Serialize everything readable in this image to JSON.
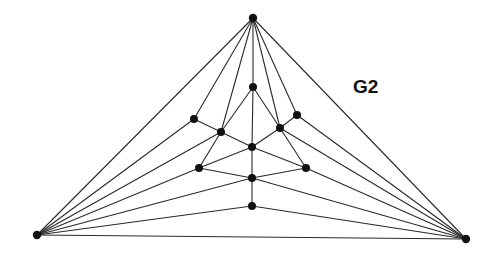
{
  "figure": {
    "label": "G2",
    "colors": {
      "edge": "#2a2a2a",
      "node": "#111111",
      "background": "#ffffff"
    },
    "nodes": [
      {
        "id": "T",
        "x": 253,
        "y": 18
      },
      {
        "id": "L",
        "x": 37,
        "y": 235
      },
      {
        "id": "R",
        "x": 466,
        "y": 239
      },
      {
        "id": "A",
        "x": 194,
        "y": 119
      },
      {
        "id": "B",
        "x": 221,
        "y": 132
      },
      {
        "id": "C",
        "x": 253,
        "y": 87
      },
      {
        "id": "D",
        "x": 280,
        "y": 128
      },
      {
        "id": "E",
        "x": 297,
        "y": 115
      },
      {
        "id": "M",
        "x": 252,
        "y": 147
      },
      {
        "id": "F",
        "x": 199,
        "y": 168
      },
      {
        "id": "G",
        "x": 306,
        "y": 168
      },
      {
        "id": "H",
        "x": 252,
        "y": 178
      },
      {
        "id": "I",
        "x": 252,
        "y": 206
      }
    ],
    "edges": [
      [
        "T",
        "L"
      ],
      [
        "T",
        "R"
      ],
      [
        "T",
        "A"
      ],
      [
        "T",
        "B"
      ],
      [
        "T",
        "C"
      ],
      [
        "T",
        "D"
      ],
      [
        "T",
        "E"
      ],
      [
        "L",
        "R"
      ],
      [
        "L",
        "A"
      ],
      [
        "L",
        "B"
      ],
      [
        "L",
        "F"
      ],
      [
        "L",
        "H"
      ],
      [
        "L",
        "I"
      ],
      [
        "R",
        "E"
      ],
      [
        "R",
        "D"
      ],
      [
        "R",
        "G"
      ],
      [
        "R",
        "H"
      ],
      [
        "R",
        "I"
      ],
      [
        "A",
        "B"
      ],
      [
        "E",
        "D"
      ],
      [
        "C",
        "B"
      ],
      [
        "C",
        "D"
      ],
      [
        "C",
        "M"
      ],
      [
        "B",
        "M"
      ],
      [
        "D",
        "M"
      ],
      [
        "B",
        "F"
      ],
      [
        "D",
        "G"
      ],
      [
        "F",
        "M"
      ],
      [
        "G",
        "M"
      ],
      [
        "F",
        "H"
      ],
      [
        "G",
        "H"
      ],
      [
        "M",
        "H"
      ],
      [
        "H",
        "I"
      ]
    ]
  }
}
